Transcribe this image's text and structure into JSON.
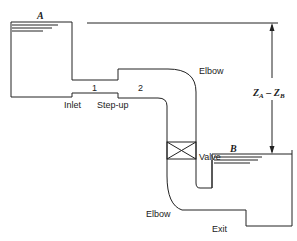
{
  "diagram": {
    "type": "pipe-flow-schematic",
    "reservoirs": [
      {
        "id": "A",
        "label": "A"
      },
      {
        "id": "B",
        "label": "B"
      }
    ],
    "labels": {
      "inlet": "Inlet",
      "section1": "1",
      "stepup": "Step-up",
      "section2": "2",
      "elbow_top": "Elbow",
      "valve": "Valve",
      "elbow_bottom": "Elbow",
      "exit": "Exit"
    },
    "head_difference": {
      "main": "Z",
      "sub_a": "A",
      "minus": " – ",
      "main2": "Z",
      "sub_b": "B"
    },
    "colors": {
      "line": "#222222",
      "background": "#ffffff"
    }
  }
}
